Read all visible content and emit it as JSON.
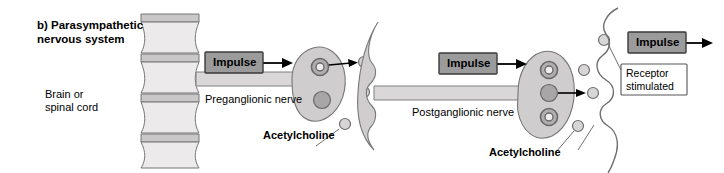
{
  "figure": {
    "panel_label": "b) Parasympathetic\nnervous system",
    "width": 724,
    "height": 173
  },
  "labels": {
    "brain_or_spinal_cord": "Brain or\nspinal cord",
    "preganglionic_nerve": "Preganglionic nerve",
    "postganglionic_nerve": "Postganglionic nerve",
    "acetylcholine_1": "Acetylcholine",
    "acetylcholine_2": "Acetylcholine",
    "receptor_stimulated": "Receptor\nstimulated"
  },
  "impulse_boxes": [
    {
      "label": "Impulse"
    },
    {
      "label": "Impulse"
    },
    {
      "label": "Impulse"
    }
  ],
  "colors": {
    "background": "#ffffff",
    "text": "#000000",
    "impulse_box_fill": "#9b9b9b",
    "impulse_box_stroke": "#3a3a3a",
    "cord_body_fill": "#eceaea",
    "cord_cap_fill": "#c9c7c7",
    "cord_stroke": "#777777",
    "axon_fill": "#d9d7d7",
    "axon_stroke": "#808080",
    "terminal_fill": "#cfcdcd",
    "terminal_stroke": "#777777",
    "vesicle_ring_fill": "#b0aeae",
    "vesicle_solid_fill": "#a8a6a6",
    "free_vesicle_fill": "#d7d5d5",
    "effector_stroke": "#6f6f6f",
    "leader_stroke": "#6f6f6f",
    "arrow_fill": "#000000",
    "receptor_box_fill": "#ffffff",
    "receptor_box_stroke": "#555555"
  },
  "structures": {
    "spinal_cord_segments": 4,
    "ganglion_1_vesicles": [
      "ring",
      "solid"
    ],
    "ganglion_2_vesicles": [
      "ring",
      "solid",
      "ring"
    ],
    "free_neurotransmitter_circles_synapse_1": 3,
    "free_neurotransmitter_circles_synapse_2": 4
  },
  "icons": {
    "arrow": "arrow-right-icon",
    "leader": "leader-line-icon"
  }
}
